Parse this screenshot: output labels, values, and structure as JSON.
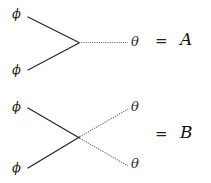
{
  "figure": {
    "background_color": "#ffffff",
    "solid_line_color": "#2b2b2b",
    "dotted_line_color": "#7a7a7a"
  },
  "diagrams": [
    {
      "id": "vertex-A",
      "type": "three-point-vertex",
      "incoming_labels": [
        "ϕ",
        "ϕ"
      ],
      "outgoing_labels": [
        "θ"
      ],
      "equals": "=",
      "amplitude": "A"
    },
    {
      "id": "vertex-B",
      "type": "four-point-crossing",
      "incoming_labels": [
        "ϕ",
        "ϕ"
      ],
      "outgoing_labels": [
        "θ",
        "θ"
      ],
      "equals": "=",
      "amplitude": "B"
    }
  ],
  "labels": {
    "a_phi_top": "ϕ",
    "a_phi_bottom": "ϕ",
    "a_theta": "θ",
    "a_equals": "=",
    "a_amplitude": "A",
    "b_phi_top": "ϕ",
    "b_phi_bottom": "ϕ",
    "b_theta_top": "θ",
    "b_theta_bottom": "θ",
    "b_equals": "=",
    "b_amplitude": "B"
  }
}
